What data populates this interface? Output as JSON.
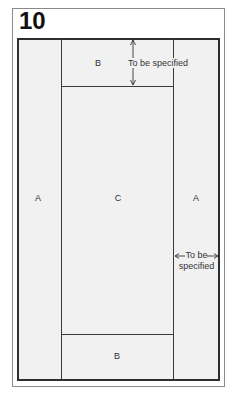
{
  "figure": {
    "number": "10",
    "regions": {
      "a_left": "A",
      "a_right": "A",
      "b_top": "B",
      "b_bottom": "B",
      "c_center": "C"
    },
    "dimension_labels": {
      "top": "To be specified",
      "side_line1": "To be",
      "side_line2": "specified"
    },
    "colors": {
      "frame": "#8a8a8a",
      "border": "#2e2e2e",
      "fill": "#f1f1f1"
    }
  }
}
